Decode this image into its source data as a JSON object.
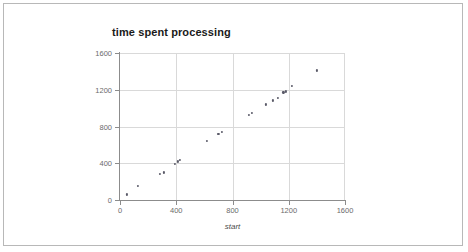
{
  "chart_data": {
    "type": "scatter",
    "title": "time spent processing",
    "xlabel": "start",
    "ylabel": "",
    "xlim": [
      0,
      1600
    ],
    "ylim": [
      0,
      1600
    ],
    "grid": true,
    "legend": null,
    "xticks": [
      0,
      400,
      800,
      1200,
      1600
    ],
    "yticks": [
      0,
      400,
      800,
      1200,
      1600
    ],
    "xtick_labels": [
      "0",
      "400",
      "800",
      "1200",
      "1600"
    ],
    "ytick_labels": [
      "0",
      "400",
      "800",
      "1200",
      "1600"
    ],
    "series": [
      {
        "name": "time spent processing",
        "marker": "dot",
        "color": "#5a5a68",
        "points": [
          [
            50,
            60
          ],
          [
            130,
            150
          ],
          [
            285,
            285
          ],
          [
            310,
            300
          ],
          [
            390,
            390
          ],
          [
            412,
            420
          ],
          [
            425,
            440
          ],
          [
            620,
            640
          ],
          [
            700,
            720
          ],
          [
            722,
            742
          ],
          [
            915,
            928
          ],
          [
            938,
            950
          ],
          [
            1040,
            1040
          ],
          [
            1090,
            1085
          ],
          [
            1120,
            1112
          ],
          [
            1162,
            1172
          ],
          [
            1180,
            1182
          ],
          [
            1222,
            1242
          ],
          [
            1400,
            1410
          ]
        ]
      }
    ]
  },
  "figure": {
    "border_color": "#b8b8b8",
    "background": "#ffffff",
    "grid_color": "#d9d9d9",
    "axis_color": "#8c8c8c",
    "tick_text_color": "#6b6b6b",
    "title_color": "#1a1a1a"
  }
}
